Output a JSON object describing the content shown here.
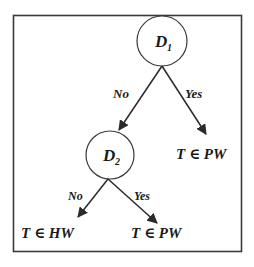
{
  "diagram": {
    "type": "decision-tree",
    "colors": {
      "stroke": "#2a2a2a",
      "text": "#1a1a1a",
      "background": "#ffffff",
      "frame": "#3a3a3a"
    },
    "nodes": [
      {
        "id": "D1",
        "label_main": "D",
        "label_sub": "1"
      },
      {
        "id": "D2",
        "label_main": "D",
        "label_sub": "2"
      }
    ],
    "leaves": [
      {
        "id": "leaf-pw-1",
        "label": "T ∈ PW"
      },
      {
        "id": "leaf-hw",
        "label": "T ∈ HW"
      },
      {
        "id": "leaf-pw-2",
        "label": "T ∈ PW"
      }
    ],
    "edges": [
      {
        "from": "D1",
        "to": "D2",
        "label": "No"
      },
      {
        "from": "D1",
        "to": "leaf-pw-1",
        "label": "Yes"
      },
      {
        "from": "D2",
        "to": "leaf-hw",
        "label": "No"
      },
      {
        "from": "D2",
        "to": "leaf-pw-2",
        "label": "Yes"
      }
    ]
  }
}
